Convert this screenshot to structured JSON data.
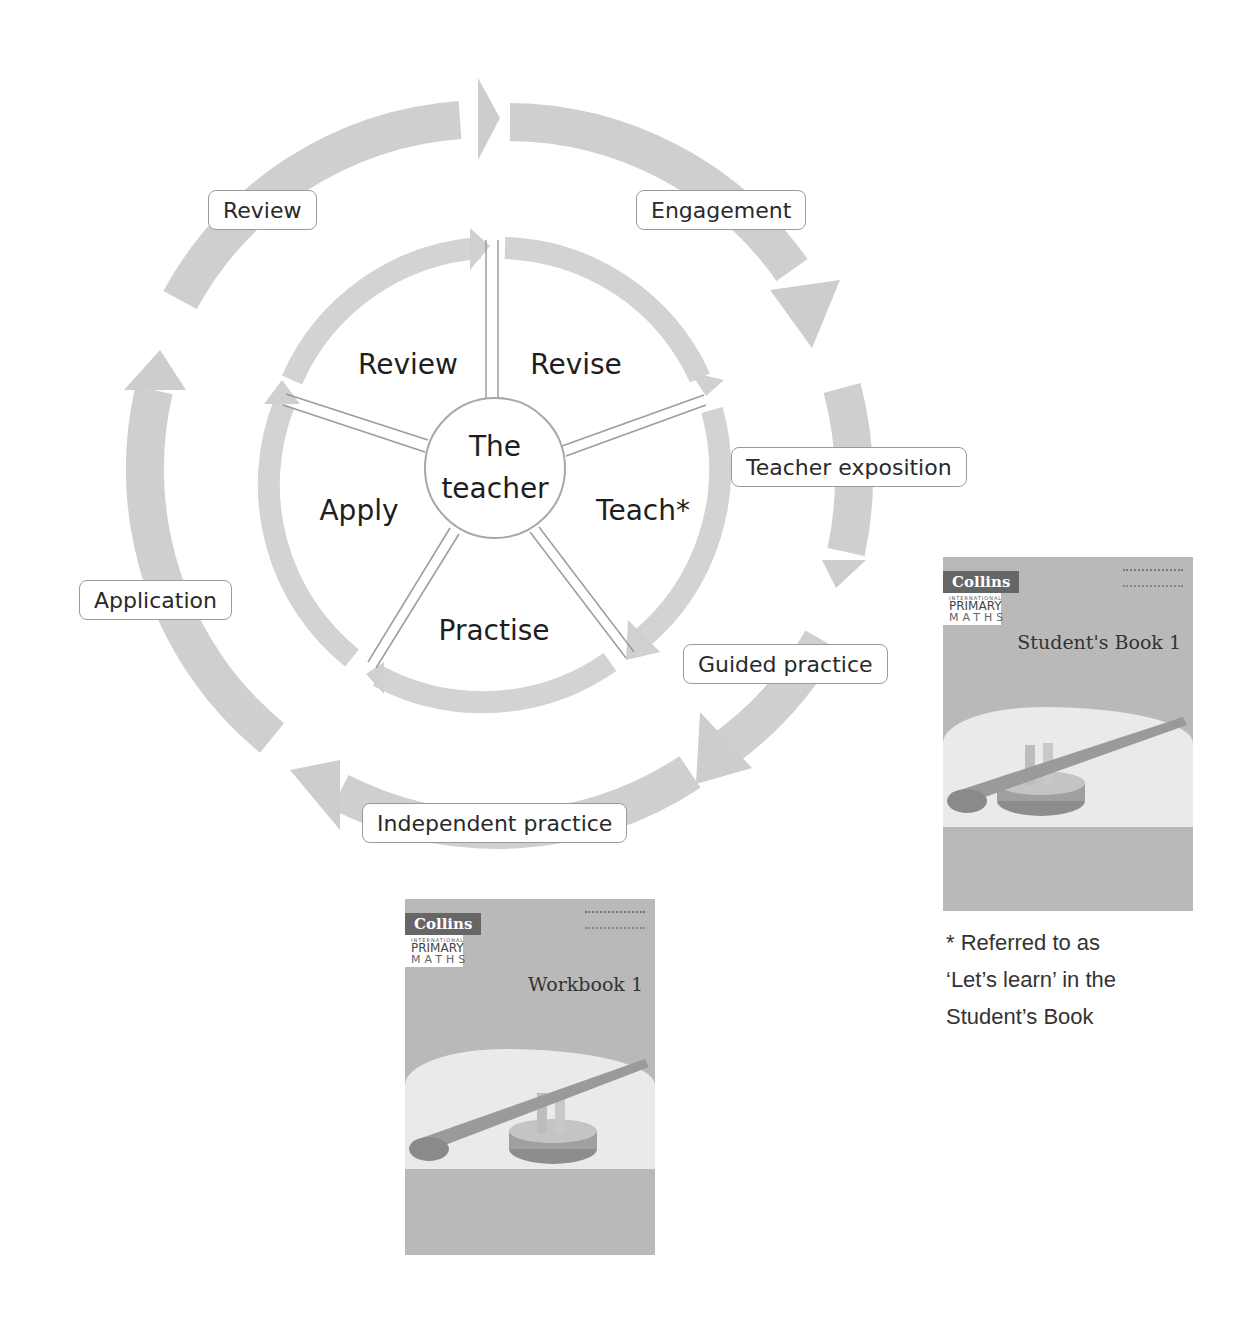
{
  "diagram": {
    "outer_cycle": {
      "labels": [
        "Engagement",
        "Teacher exposition",
        "Guided practice",
        "Independent practice",
        "Application",
        "Review"
      ],
      "arrow_color": "#cfcfcf"
    },
    "inner_cycle": {
      "hub": {
        "line1": "The",
        "line2": "teacher"
      },
      "segments": [
        "Revise",
        "Teach*",
        "Practise",
        "Apply",
        "Review"
      ],
      "arrow_color": "#d3d3d3"
    }
  },
  "books": {
    "student": {
      "brand": "Collins",
      "series_top": "INTERNATIONAL",
      "series_mid": "PRIMARY",
      "series_bottom": "MATHS",
      "title": "Student's Book 1"
    },
    "workbook": {
      "brand": "Collins",
      "series_top": "INTERNATIONAL",
      "series_mid": "PRIMARY",
      "series_bottom": "MATHS",
      "title": "Workbook 1"
    }
  },
  "footnote": {
    "line1": "* Referred to as",
    "line2": "‘Let’s learn’ in the",
    "line3": "Student’s Book"
  }
}
